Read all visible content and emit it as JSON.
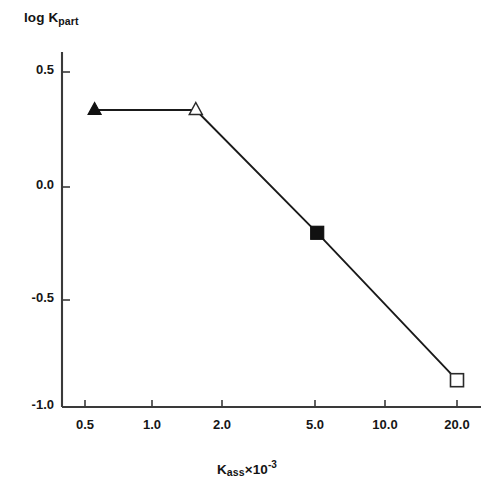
{
  "chart_data": {
    "type": "line",
    "title": "",
    "subtitle": "",
    "xlabel": "K_ass x 10^-3",
    "ylabel": "log K_part",
    "xscale": "log",
    "yscale": "linear",
    "xlim": [
      0.42,
      26.0
    ],
    "ylim": [
      -1.0,
      0.65
    ],
    "grid": false,
    "legend": "none",
    "xticks": [
      0.5,
      1.0,
      2.0,
      5.0,
      10.0,
      20.0
    ],
    "xtick_labels": [
      "0.5",
      "1.0",
      "2.0",
      "5.0",
      "10.0",
      "20.0"
    ],
    "yticks": [
      0.5,
      0.0,
      -0.5,
      -1.0
    ],
    "ytick_labels": [
      "0.5",
      "0.0",
      "-0.5",
      "-1.0"
    ],
    "series": [
      {
        "name": "partition coefficient vs association constant",
        "line_color": "#1a1a1a",
        "points": [
          {
            "x": 0.55,
            "y": 0.33,
            "marker": "filled-triangle",
            "label": "0.55, 0.33"
          },
          {
            "x": 1.5,
            "y": 0.33,
            "marker": "open-triangle",
            "label": "1.5, 0.33"
          },
          {
            "x": 5.0,
            "y": -0.22,
            "marker": "filled-square",
            "label": "5.0, -0.22"
          },
          {
            "x": 20.0,
            "y": -0.88,
            "marker": "open-square",
            "label": "20.0, -0.88"
          }
        ]
      }
    ]
  },
  "axes": {
    "y_title_main": "log K",
    "y_title_sub": "part",
    "x_title_main": "K",
    "x_title_sub": "ass",
    "x_title_mult": "×10",
    "x_title_exp": "-3"
  },
  "ticks": {
    "y": [
      {
        "label": "0.5",
        "value": 0.5
      },
      {
        "label": "0.0",
        "value": 0.0
      },
      {
        "label": "-0.5",
        "value": -0.5
      },
      {
        "label": "-1.0",
        "value": -1.0
      }
    ],
    "x": [
      {
        "label": "0.5",
        "value": 0.5
      },
      {
        "label": "1.0",
        "value": 1.0
      },
      {
        "label": "2.0",
        "value": 2.0
      },
      {
        "label": "5.0",
        "value": 5.0
      },
      {
        "label": "10.0",
        "value": 10.0
      },
      {
        "label": "20.0",
        "value": 20.0
      }
    ]
  },
  "colors": {
    "axis": "#3a3a3a",
    "line": "#1a1a1a",
    "marker_fill": "#111111",
    "marker_open": "#ffffff",
    "text": "#141414",
    "background": "#ffffff"
  }
}
